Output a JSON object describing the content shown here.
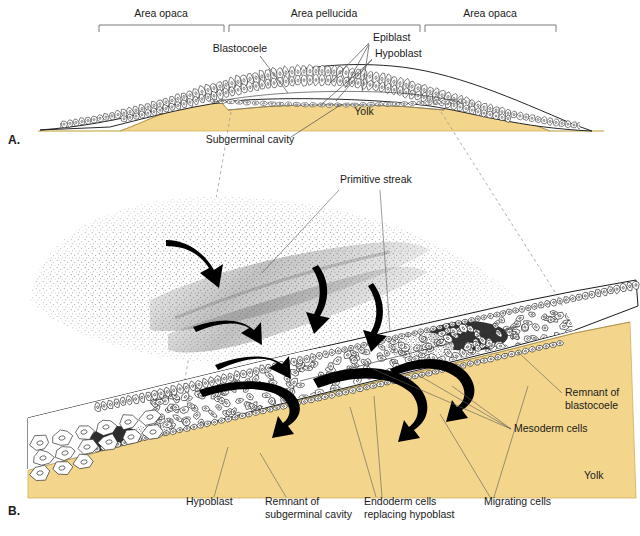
{
  "figure": {
    "panels": [
      {
        "id": "A",
        "label": "A."
      },
      {
        "id": "B",
        "label": "B."
      }
    ]
  },
  "panel_a": {
    "brackets": [
      {
        "label": "Area opaca",
        "x1": 99,
        "x2": 224,
        "text_x": 161,
        "text_y": 17
      },
      {
        "label": "Area pellucida",
        "x1": 229,
        "x2": 420,
        "text_x": 324,
        "text_y": 17
      },
      {
        "label": "Area opaca",
        "x1": 425,
        "x2": 556,
        "text_x": 490,
        "text_y": 17
      }
    ],
    "labels": [
      {
        "name": "blastocoele",
        "text": "Blastocoele",
        "x": 240,
        "y": 52,
        "anchor": "middle"
      },
      {
        "name": "epiblast",
        "text": "Epiblast",
        "x": 373,
        "y": 41,
        "anchor": "start"
      },
      {
        "name": "hypoblast",
        "text": "Hypoblast",
        "x": 375,
        "y": 57,
        "anchor": "start"
      },
      {
        "name": "yolk",
        "text": "Yolk",
        "x": 364,
        "y": 115,
        "anchor": "middle"
      },
      {
        "name": "subgerminal-cavity",
        "text": "Subgerminal cavity",
        "x": 250,
        "y": 143,
        "anchor": "middle"
      }
    ]
  },
  "panel_b": {
    "labels": [
      {
        "name": "primitive-streak",
        "text": "Primitive streak",
        "x": 340,
        "y": 183,
        "anchor": "start"
      },
      {
        "name": "remnant-of-blastocoele-1",
        "text": "Remnant of",
        "x": 565,
        "y": 396,
        "anchor": "start"
      },
      {
        "name": "remnant-of-blastocoele-2",
        "text": "blastocoele",
        "x": 565,
        "y": 409,
        "anchor": "start"
      },
      {
        "name": "mesoderm-cells",
        "text": "Mesoderm cells",
        "x": 514,
        "y": 432,
        "anchor": "start"
      },
      {
        "name": "yolk",
        "text": "Yolk",
        "x": 584,
        "y": 479,
        "anchor": "start"
      },
      {
        "name": "hypoblast",
        "text": "Hypoblast",
        "x": 186,
        "y": 505,
        "anchor": "start"
      },
      {
        "name": "remnant-subgerminal-1",
        "text": "Remnant of",
        "x": 265,
        "y": 505,
        "anchor": "start"
      },
      {
        "name": "remnant-subgerminal-2",
        "text": "subgerminal cavity",
        "x": 265,
        "y": 518,
        "anchor": "start"
      },
      {
        "name": "endoderm-cells-1",
        "text": "Endoderm cells",
        "x": 364,
        "y": 505,
        "anchor": "start"
      },
      {
        "name": "endoderm-cells-2",
        "text": "replacing hypoblast",
        "x": 364,
        "y": 518,
        "anchor": "start"
      },
      {
        "name": "migrating-cells",
        "text": "Migrating cells",
        "x": 484,
        "y": 505,
        "anchor": "start"
      }
    ]
  },
  "colors": {
    "yolk": "#f3d68c",
    "yolk_edge": "#c9a94f",
    "cell_outline": "#1a1a1a",
    "leader": "#4a4a4a",
    "bracket": "#6b6b6b",
    "dashed_guide": "#9a9a9a",
    "arrow": "#000000",
    "stipple": "#555555",
    "background": "#ffffff"
  }
}
